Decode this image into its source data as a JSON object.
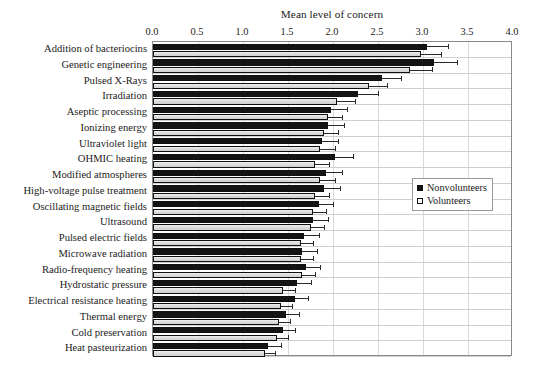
{
  "chart_data": {
    "type": "bar",
    "orientation": "horizontal",
    "title": "Mean level of concern",
    "xlabel": "Mean level of concern",
    "ylabel": "",
    "xlim": [
      0.0,
      4.0
    ],
    "xticks": [
      "0.0",
      "0.5",
      "1.0",
      "1.5",
      "2.0",
      "2.5",
      "3.0",
      "3.5",
      "4.0"
    ],
    "xtick_values": [
      0.0,
      0.5,
      1.0,
      1.5,
      2.0,
      2.5,
      3.0,
      3.5,
      4.0
    ],
    "grid": true,
    "grid_axis": "x",
    "legend_position": "center-right",
    "categories": [
      "Addition of bacteriocins",
      "Genetic engineering",
      "Pulsed X-Rays",
      "Irradiation",
      "Aseptic processing",
      "Ionizing energy",
      "Ultraviolet light",
      "OHMIC heating",
      "Modified atmospheres",
      "High-voltage pulse treatment",
      "Oscillating magnetic fields",
      "Ultrasound",
      "Pulsed electric fields",
      "Microwave radiation",
      "Radio-frequency heating",
      "Hydrostatic pressure",
      "Electrical resistance heating",
      "Thermal energy",
      "Cold preservation",
      "Heat pasteurization"
    ],
    "series": [
      {
        "name": "Nonvolunteers",
        "color": "#141414",
        "values": [
          3.04,
          3.12,
          2.54,
          2.28,
          1.98,
          1.94,
          1.88,
          2.02,
          1.92,
          1.9,
          1.84,
          1.78,
          1.68,
          1.66,
          1.7,
          1.6,
          1.58,
          1.48,
          1.44,
          1.28
        ],
        "errors": [
          0.24,
          0.26,
          0.22,
          0.22,
          0.18,
          0.18,
          0.18,
          0.2,
          0.18,
          0.18,
          0.16,
          0.16,
          0.16,
          0.16,
          0.16,
          0.16,
          0.14,
          0.14,
          0.14,
          0.14
        ]
      },
      {
        "name": "Volunteers",
        "color": "#dcdcdc",
        "values": [
          2.98,
          2.86,
          2.4,
          2.04,
          1.94,
          1.9,
          1.86,
          1.8,
          1.86,
          1.8,
          1.78,
          1.76,
          1.64,
          1.64,
          1.66,
          1.44,
          1.42,
          1.4,
          1.38,
          1.24
        ],
        "errors": [
          0.22,
          0.24,
          0.2,
          0.2,
          0.16,
          0.16,
          0.16,
          0.16,
          0.16,
          0.16,
          0.14,
          0.14,
          0.14,
          0.14,
          0.14,
          0.14,
          0.12,
          0.12,
          0.12,
          0.12
        ]
      }
    ]
  },
  "legend": {
    "items": [
      {
        "label": "Nonvolunteers",
        "style": "filled"
      },
      {
        "label": "Volunteers",
        "style": "open"
      }
    ]
  }
}
